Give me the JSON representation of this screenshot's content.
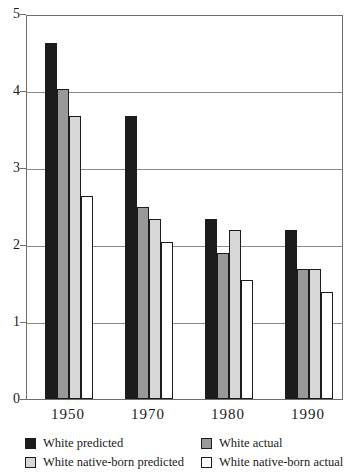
{
  "chart_data": {
    "type": "bar",
    "title": "",
    "xlabel": "",
    "ylabel": "",
    "categories": [
      "1950",
      "1970",
      "1980",
      "1990"
    ],
    "series": [
      {
        "name": "White predicted",
        "color": "#1c1c1c",
        "values": [
          4.65,
          3.7,
          2.35,
          2.2
        ]
      },
      {
        "name": "White actual",
        "color": "#999999",
        "values": [
          4.05,
          2.5,
          1.9,
          1.7
        ]
      },
      {
        "name": "White native-born predicted",
        "color": "#d7d7d7",
        "values": [
          3.7,
          2.35,
          2.2,
          1.7
        ]
      },
      {
        "name": "White native-born actual",
        "color": "#ffffff",
        "values": [
          2.65,
          2.05,
          1.55,
          1.4
        ]
      }
    ],
    "ylim": [
      0,
      5
    ],
    "yticks": [
      "0",
      "1",
      "2",
      "3",
      "4",
      "5"
    ],
    "grid": true,
    "legend_position": "bottom"
  },
  "legend": {
    "columns": [
      {
        "x": 25,
        "series_indexes": [
          0,
          2
        ]
      },
      {
        "x": 201,
        "series_indexes": [
          1,
          3
        ]
      }
    ],
    "row_tops": [
      4,
      23
    ]
  },
  "colors": {
    "gridline": "#8a8a8a",
    "plot_border": "#6e6e6e",
    "bar_outline": "#1c1c1c",
    "text": "#1a1a1a"
  }
}
